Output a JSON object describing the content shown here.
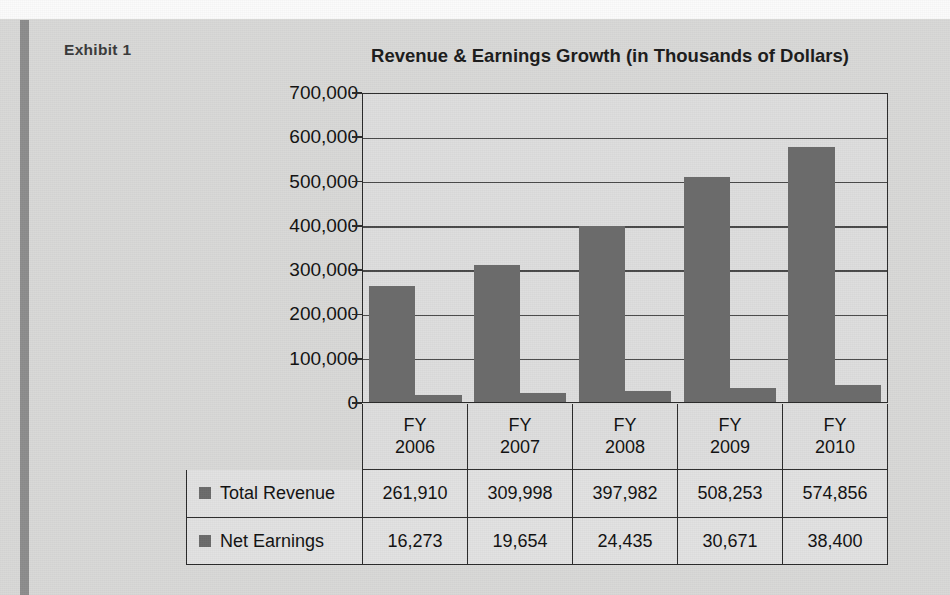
{
  "page": {
    "exhibit_label": "Exhibit 1",
    "background_color": "#d9d9d7",
    "rule_color": "#8d8d8d"
  },
  "chart_data": {
    "type": "bar",
    "title": "Revenue & Earnings Growth (in Thousands of Dollars)",
    "xlabel": "",
    "ylabel": "",
    "ylim": [
      0,
      700000
    ],
    "grid": true,
    "legend_position": "table-below",
    "categories": [
      "FY 2006",
      "FY 2007",
      "FY 2008",
      "FY 2009",
      "FY 2010"
    ],
    "category_lines": [
      [
        "FY",
        "2006"
      ],
      [
        "FY",
        "2007"
      ],
      [
        "FY",
        "2008"
      ],
      [
        "FY",
        "2009"
      ],
      [
        "FY",
        "2010"
      ]
    ],
    "ytick_labels": [
      "700,000",
      "600,000",
      "500,000",
      "400,000",
      "300,000",
      "200,000",
      "100,000",
      "0"
    ],
    "ytick_values": [
      700000,
      600000,
      500000,
      400000,
      300000,
      200000,
      100000,
      0
    ],
    "series": [
      {
        "name": "Total Revenue",
        "color": "#6b6b6b",
        "values": [
          261910,
          309998,
          397982,
          508253,
          574856
        ],
        "display": [
          "261,910",
          "309,998",
          "397,982",
          "508,253",
          "574,856"
        ]
      },
      {
        "name": "Net Earnings",
        "color": "#6b6b6b",
        "values": [
          16273,
          19654,
          24435,
          30671,
          38400
        ],
        "display": [
          "16,273",
          "19,654",
          "24,435",
          "30,671",
          "38,400"
        ]
      }
    ]
  },
  "table": {
    "rows": [
      {
        "label": "Total Revenue",
        "cells": [
          "261,910",
          "309,998",
          "397,982",
          "508,253",
          "574,856"
        ]
      },
      {
        "label": "Net Earnings",
        "cells": [
          "16,273",
          "19,654",
          "24,435",
          "30,671",
          "38,400"
        ]
      }
    ]
  }
}
